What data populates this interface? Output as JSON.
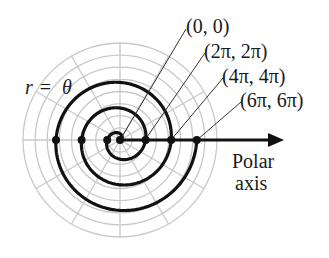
{
  "figure": {
    "equation_label": "r = θ",
    "equation_parts": {
      "left": "r",
      "eq": "=",
      "right": "θ"
    },
    "axis_label_line1": "Polar",
    "axis_label_line2": "axis",
    "points": [
      {
        "label": "(0, 0)",
        "theta_pi": 0
      },
      {
        "label": "(2π, 2π)",
        "theta_pi": 2
      },
      {
        "label": "(4π, 4π)",
        "theta_pi": 4
      },
      {
        "label": "(6π, 6π)",
        "theta_pi": 6
      }
    ],
    "colors": {
      "grid": "#c8c8c8",
      "curve": "#111111",
      "text": "#1a1a1a"
    }
  },
  "chart_data": {
    "type": "polar-line",
    "title": "",
    "equation": "r = θ",
    "theta_range": [
      0,
      "6π"
    ],
    "grid": {
      "rings": 8,
      "spokes_deg": 30
    },
    "highlighted_points": [
      {
        "theta": "0",
        "r": "0",
        "label": "(0, 0)"
      },
      {
        "theta": "2π",
        "r": "2π",
        "label": "(2π, 2π)"
      },
      {
        "theta": "4π",
        "r": "4π",
        "label": "(4π, 4π)"
      },
      {
        "theta": "6π",
        "r": "6π",
        "label": "(6π, 6π)"
      }
    ],
    "axis_crossings_left": [
      "π",
      "3π",
      "5π"
    ],
    "axis_label": "Polar axis"
  }
}
